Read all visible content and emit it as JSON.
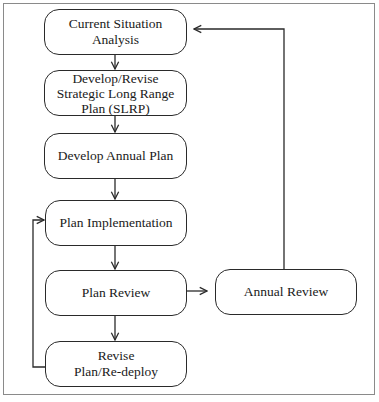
{
  "diagram": {
    "type": "flowchart",
    "nodes": [
      {
        "id": "n1",
        "label": "Current Situation\nAnalysis"
      },
      {
        "id": "n2",
        "label": "Develop/Revise\nStrategic Long Range\nPlan (SLRP)"
      },
      {
        "id": "n3",
        "label": "Develop Annual Plan"
      },
      {
        "id": "n4",
        "label": "Plan Implementation"
      },
      {
        "id": "n5",
        "label": "Plan Review"
      },
      {
        "id": "n6",
        "label": "Revise\nPlan/Re-deploy"
      },
      {
        "id": "n7",
        "label": "Annual Review"
      }
    ],
    "edges": [
      {
        "from": "n1",
        "to": "n2"
      },
      {
        "from": "n2",
        "to": "n3"
      },
      {
        "from": "n3",
        "to": "n4"
      },
      {
        "from": "n4",
        "to": "n5"
      },
      {
        "from": "n5",
        "to": "n6"
      },
      {
        "from": "n5",
        "to": "n7"
      },
      {
        "from": "n6",
        "to": "n4"
      },
      {
        "from": "n7",
        "to": "n1"
      }
    ],
    "colors": {
      "stroke": "#2a2a2a",
      "frame": "#8a8a8a",
      "background": "#ffffff"
    }
  }
}
